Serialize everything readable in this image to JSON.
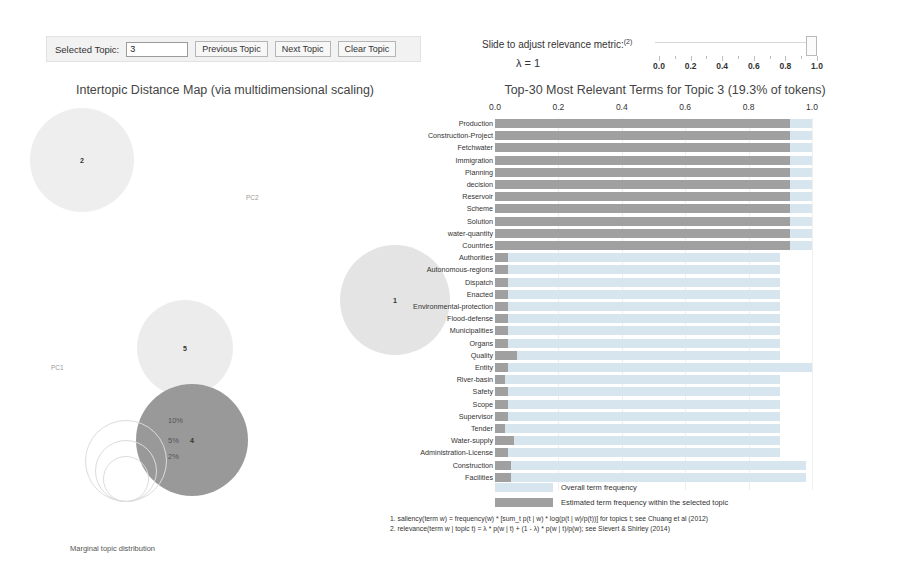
{
  "topic_controls": {
    "selected_topic_label": "Selected Topic:",
    "selected_topic_value": "3",
    "previous_topic_label": "Previous Topic",
    "next_topic_label": "Next Topic",
    "clear_topic_label": "Clear Topic"
  },
  "lambda_panel": {
    "slide_label": "Slide to adjust relevance metric:",
    "slide_label_sup": "(2)",
    "lambda_value": "λ = 1",
    "tick_labels": [
      "0.0",
      "0.2",
      "0.4",
      "0.6",
      "0.8",
      "1.0"
    ],
    "handle_position": "1.0"
  },
  "intertopic_map": {
    "title": "Intertopic Distance Map (via multidimensional scaling)",
    "pc1_label": "PC1",
    "pc2_label": "PC2",
    "topics": [
      {
        "id": "2",
        "x": 82,
        "y": 160,
        "r": 52,
        "fill": "#eeeeee"
      },
      {
        "id": "1",
        "x": 395,
        "y": 300,
        "r": 55,
        "fill": "#e4e4e4"
      },
      {
        "id": "5",
        "x": 185,
        "y": 348,
        "r": 48,
        "fill": "#ececec"
      },
      {
        "id": "4",
        "x": 192,
        "y": 440,
        "r": 56,
        "fill": "#999999"
      }
    ],
    "marginal_label": "Marginal topic distribution",
    "marginal_sizes": [
      "2%",
      "5%",
      "10%"
    ]
  },
  "barchart": {
    "title": "Top-30 Most Relevant Terms for Topic 3 (19.3% of tokens)",
    "legend": [
      {
        "swatch": "#d7e5ef",
        "label": "Overall term frequency"
      },
      {
        "swatch": "#a0a0a0",
        "label": "Estimated term frequency within the selected topic"
      }
    ],
    "footnotes": [
      "1. saliency(term w) = frequency(w) * [sum_t p(t | w) * log(p(t | w)/p(t))] for topics t; see Chuang et al (2012)",
      "2. relevance(term w | topic t) = λ * p(w | t) + (1 - λ) * p(w | t)/p(w); see Sievert & Shirley (2014)"
    ]
  },
  "chart_data": {
    "type": "bar",
    "title": "Top-30 Most Relevant Terms for Topic 3 (19.3% of tokens)",
    "xlabel": "",
    "ylabel": "",
    "xlim": [
      0,
      1.0
    ],
    "axis_ticks": [
      "0.0",
      "0.2",
      "0.4",
      "0.6",
      "0.8",
      "1.0"
    ],
    "grid": true,
    "legend_position": "bottom-left",
    "orientation": "horizontal",
    "categories": [
      "Production",
      "Construction-Project",
      "Fetchwater",
      "Immigration",
      "Planning",
      "decision",
      "Reservoir",
      "Scheme",
      "Solution",
      "water-quantity",
      "Countries",
      "Authorities",
      "Autonomous-regions",
      "Dispatch",
      "Enacted",
      "Environmental-protection",
      "Flood-defense",
      "Municipalities",
      "Organs",
      "Quality",
      "Entity",
      "River-basin",
      "Safety",
      "Scope",
      "Supervisor",
      "Tender",
      "Water-supply",
      "Administration-License",
      "Construction",
      "Facilities"
    ],
    "series": [
      {
        "name": "Overall term frequency",
        "values": [
          1.0,
          1.0,
          1.0,
          1.0,
          1.0,
          1.0,
          1.0,
          1.0,
          1.0,
          1.0,
          1.0,
          0.9,
          0.9,
          0.9,
          0.9,
          0.9,
          0.9,
          0.9,
          0.9,
          0.9,
          1.0,
          0.9,
          0.9,
          0.9,
          0.9,
          0.9,
          0.9,
          0.9,
          0.98,
          0.98
        ]
      },
      {
        "name": "Estimated term frequency within the selected topic",
        "values": [
          0.93,
          0.93,
          0.93,
          0.93,
          0.93,
          0.93,
          0.93,
          0.93,
          0.93,
          0.93,
          0.93,
          0.04,
          0.04,
          0.04,
          0.04,
          0.04,
          0.04,
          0.04,
          0.04,
          0.07,
          0.04,
          0.03,
          0.04,
          0.04,
          0.04,
          0.03,
          0.06,
          0.04,
          0.05,
          0.05
        ]
      }
    ]
  }
}
